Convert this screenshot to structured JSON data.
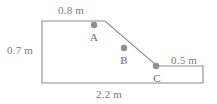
{
  "figure": {
    "type": "engineering-cross-section-diagram",
    "stroke_color": "#8c8c8c",
    "dot_color": "#8f8f8f",
    "text_color": "#787878",
    "background_color": "#ffffff",
    "outline_points": "42,21 105,21 157,66 203,66 203,83 42,83",
    "dimensions": [
      {
        "id": "top",
        "label": "0.8 m",
        "edge": "top-horizontal"
      },
      {
        "id": "left",
        "label": "0.7 m",
        "edge": "left-vertical"
      },
      {
        "id": "right",
        "label": "0.5 m",
        "edge": "right-ledge-horizontal"
      },
      {
        "id": "bottom",
        "label": "2.2 m",
        "edge": "bottom-horizontal"
      }
    ],
    "points": [
      {
        "id": "A",
        "label": "A",
        "cx": 94,
        "cy": 25,
        "r": 3.2
      },
      {
        "id": "B",
        "label": "B",
        "cx": 124,
        "cy": 48,
        "r": 3.2
      },
      {
        "id": "C",
        "label": "C",
        "cx": 156,
        "cy": 66,
        "r": 3.2
      }
    ]
  }
}
